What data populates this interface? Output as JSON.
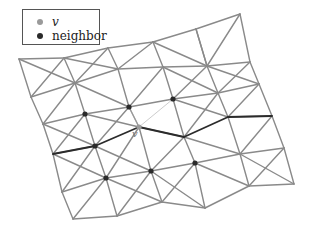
{
  "legend": {
    "items": [
      {
        "label": "v",
        "color": "#9a9a9a"
      },
      {
        "label": "neighbor",
        "color": "#2a2a2a"
      }
    ]
  },
  "mesh": {
    "edge_color": "#8a8a8a",
    "edge_width": 1.4,
    "vertices": {
      "A0": [
        19,
        59
      ],
      "A1": [
        64,
        58
      ],
      "A2": [
        108,
        48
      ],
      "A3": [
        153,
        42
      ],
      "A4": [
        196,
        29
      ],
      "A5": [
        240,
        14
      ],
      "B0": [
        31,
        97
      ],
      "B1": [
        75,
        83
      ],
      "B2": [
        118,
        69
      ],
      "B3": [
        163,
        67
      ],
      "B4": [
        207,
        66
      ],
      "B5": [
        250,
        62
      ],
      "C0": [
        43,
        124
      ],
      "C1": [
        85,
        114
      ],
      "C2": [
        129,
        107
      ],
      "C3": [
        173,
        99
      ],
      "C4": [
        218,
        93
      ],
      "C5": [
        259,
        84
      ],
      "D0": [
        53,
        154
      ],
      "D1": [
        95,
        146
      ],
      "D2": [
        139,
        127
      ],
      "D3": [
        184,
        137
      ],
      "D4": [
        228,
        117
      ],
      "D5": [
        272,
        116
      ],
      "E0": [
        62,
        192
      ],
      "E1": [
        106,
        178
      ],
      "E2": [
        151,
        171
      ],
      "E3": [
        195,
        163
      ],
      "E4": [
        240,
        154
      ],
      "E5": [
        284,
        148
      ],
      "F0": [
        73,
        219
      ],
      "F1": [
        117,
        216
      ],
      "F2": [
        162,
        202
      ],
      "F3": [
        205,
        208
      ],
      "F4": [
        249,
        186
      ],
      "F5": [
        294,
        184
      ]
    },
    "edges": [
      [
        "A0",
        "A1"
      ],
      [
        "A1",
        "A2"
      ],
      [
        "A2",
        "A3"
      ],
      [
        "A3",
        "A4"
      ],
      [
        "A4",
        "A5"
      ],
      [
        "B0",
        "B1"
      ],
      [
        "B1",
        "B2"
      ],
      [
        "B2",
        "B3"
      ],
      [
        "B3",
        "B4"
      ],
      [
        "B4",
        "B5"
      ],
      [
        "C0",
        "C1"
      ],
      [
        "C1",
        "C2"
      ],
      [
        "C2",
        "C3"
      ],
      [
        "C3",
        "C4"
      ],
      [
        "C4",
        "C5"
      ],
      [
        "D0",
        "D1"
      ],
      [
        "D2",
        "D3"
      ],
      [
        "D4",
        "D5"
      ],
      [
        "E0",
        "E1"
      ],
      [
        "E1",
        "E2"
      ],
      [
        "E2",
        "E3"
      ],
      [
        "E3",
        "E4"
      ],
      [
        "E4",
        "E5"
      ],
      [
        "F0",
        "F1"
      ],
      [
        "F1",
        "F2"
      ],
      [
        "F2",
        "F3"
      ],
      [
        "F3",
        "F4"
      ],
      [
        "F4",
        "F5"
      ],
      [
        "A0",
        "B0"
      ],
      [
        "B0",
        "C0"
      ],
      [
        "C0",
        "D0"
      ],
      [
        "D0",
        "E0"
      ],
      [
        "E0",
        "F0"
      ],
      [
        "A1",
        "B1"
      ],
      [
        "B1",
        "C1"
      ],
      [
        "C1",
        "D1"
      ],
      [
        "D1",
        "E1"
      ],
      [
        "E1",
        "F1"
      ],
      [
        "A2",
        "B2"
      ],
      [
        "B2",
        "C2"
      ],
      [
        "C2",
        "D2"
      ],
      [
        "D2",
        "E2"
      ],
      [
        "E2",
        "F2"
      ],
      [
        "A3",
        "B3"
      ],
      [
        "B3",
        "C3"
      ],
      [
        "C3",
        "D3"
      ],
      [
        "D3",
        "E3"
      ],
      [
        "E3",
        "F3"
      ],
      [
        "A4",
        "B4"
      ],
      [
        "B4",
        "C4"
      ],
      [
        "C4",
        "D4"
      ],
      [
        "D4",
        "E4"
      ],
      [
        "E4",
        "F4"
      ],
      [
        "A5",
        "B5"
      ],
      [
        "B5",
        "C5"
      ],
      [
        "C5",
        "D5"
      ],
      [
        "D5",
        "E5"
      ],
      [
        "E5",
        "F5"
      ],
      [
        "A1",
        "B0"
      ],
      [
        "A1",
        "B2"
      ],
      [
        "A3",
        "B2"
      ],
      [
        "A3",
        "B4"
      ],
      [
        "A5",
        "B4"
      ],
      [
        "B1",
        "C0"
      ],
      [
        "B1",
        "C2"
      ],
      [
        "B3",
        "C2"
      ],
      [
        "B3",
        "C4"
      ],
      [
        "B5",
        "C4"
      ],
      [
        "B1",
        "A0"
      ],
      [
        "B1",
        "A2"
      ],
      [
        "B4",
        "A4"
      ],
      [
        "B4",
        "C5"
      ],
      [
        "B4",
        "C3"
      ],
      [
        "C1",
        "D0"
      ],
      [
        "C1",
        "D2"
      ],
      [
        "C3",
        "D4"
      ],
      [
        "C5",
        "D4"
      ],
      [
        "D1",
        "C0"
      ],
      [
        "D1",
        "C2"
      ],
      [
        "D3",
        "C4"
      ],
      [
        "D1",
        "E0"
      ],
      [
        "D1",
        "E2"
      ],
      [
        "D3",
        "E2"
      ],
      [
        "D3",
        "E4"
      ],
      [
        "D5",
        "E4"
      ],
      [
        "E1",
        "F0"
      ],
      [
        "E1",
        "F2"
      ],
      [
        "E3",
        "F2"
      ],
      [
        "E3",
        "F4"
      ],
      [
        "E5",
        "F4"
      ],
      [
        "E2",
        "F1"
      ],
      [
        "E2",
        "F3"
      ],
      [
        "E1",
        "D0"
      ],
      [
        "E1",
        "D2"
      ],
      [
        "E4",
        "F5"
      ]
    ],
    "path_edges": [
      [
        "D0",
        "D1"
      ],
      [
        "D1",
        "D2"
      ],
      [
        "D2",
        "D3"
      ],
      [
        "D3",
        "D4"
      ],
      [
        "D4",
        "D5"
      ]
    ],
    "path_color": "#2b2b2b",
    "thin_edges": [
      [
        "D2",
        "C2"
      ],
      [
        "D2",
        "C3"
      ]
    ],
    "thin_color": "#aaaaaa",
    "v_vertex": "D2",
    "neighbor_vertices": [
      "C1",
      "C2",
      "C3",
      "D1",
      "E1",
      "E2",
      "E3"
    ],
    "v_label": "v"
  }
}
